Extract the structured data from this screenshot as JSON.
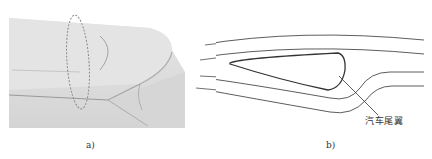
{
  "figure": {
    "panels": [
      {
        "id": "a",
        "caption": "a)",
        "description": "3D render of car rear spoiler with dashed ellipse marking cross-section location"
      },
      {
        "id": "b",
        "caption": "b)",
        "description": "Airflow streamlines around rear spoiler cross-section",
        "callout_label": "汽车尾翼"
      }
    ],
    "colors": {
      "surface": "#dcdcdc",
      "surface_light": "#ebebeb",
      "line": "#333333",
      "dashed": "#8a8a8a"
    }
  }
}
